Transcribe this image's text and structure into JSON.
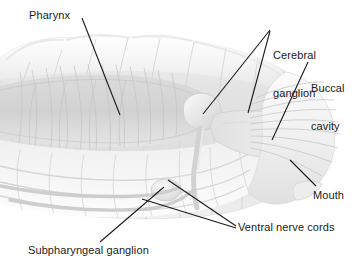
{
  "figure": {
    "background_color": "#ffffff",
    "label_color": "#1a1a1a",
    "leader_line_color": "#1a1a1a",
    "body_tint": "#e8e8e8",
    "body_shadow": "#cfcfcf",
    "body_highlight": "#f7f7f7",
    "organ_tint": "#dcdcdc",
    "fiber_color": "#c8c8c8"
  },
  "labels": {
    "pharynx": "Pharynx",
    "cerebral_ganglion_line1": "Cerebral",
    "cerebral_ganglion_line2": "ganglion",
    "buccal_cavity_line1": "Buccal",
    "buccal_cavity_line2": "cavity",
    "mouth": "Mouth",
    "ventral_nerve_cords": "Ventral nerve cords",
    "subpharyngeal_ganglion": "Subpharyngeal ganglion"
  }
}
